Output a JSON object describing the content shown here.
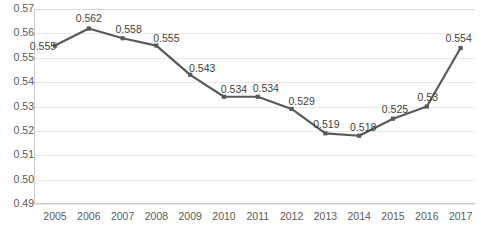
{
  "chart_data": {
    "type": "line",
    "title": "",
    "subtitle": "",
    "xlabel": "",
    "ylabel": "",
    "categories": [
      "2005",
      "2006",
      "2007",
      "2008",
      "2009",
      "2010",
      "2011",
      "2012",
      "2013",
      "2014",
      "2015",
      "2016",
      "2017"
    ],
    "values": [
      0.555,
      0.562,
      0.558,
      0.555,
      0.543,
      0.534,
      0.534,
      0.529,
      0.519,
      0.518,
      0.525,
      0.53,
      0.554
    ],
    "point_labels": [
      "0.555",
      "0.562",
      "0.558",
      "0.555",
      "0.543",
      "0.534",
      "0.534",
      "0.529",
      "0.519",
      "0.518",
      "0.525",
      "0.53",
      "0.554"
    ],
    "ylim": [
      0.49,
      0.57
    ],
    "ytick_values": [
      0.49,
      0.5,
      0.51,
      0.52,
      0.53,
      0.54,
      0.55,
      0.56,
      0.57
    ],
    "ytick_labels": [
      "0.49",
      "0.50",
      "0.51",
      "0.52",
      "0.53",
      "0.54",
      "0.55",
      "0.56",
      "0.57"
    ],
    "grid": true,
    "legend": "none",
    "series": [
      {
        "name": "series-1",
        "color": "#595959",
        "marker": "square",
        "values": [
          0.555,
          0.562,
          0.558,
          0.555,
          0.543,
          0.534,
          0.534,
          0.529,
          0.519,
          0.518,
          0.525,
          0.53,
          0.554
        ]
      }
    ]
  },
  "colors": {
    "line": "#595959",
    "gridline": "#e8e8e8",
    "axis": "#c9c9c9",
    "tick_text": "#5a5a5a",
    "label_text": "#3f3f3f",
    "background": "#ffffff"
  }
}
